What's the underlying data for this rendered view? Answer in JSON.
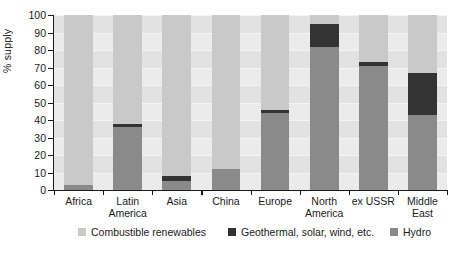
{
  "chart_data": {
    "type": "bar",
    "title": "",
    "subtitle": "",
    "xlabel": "",
    "ylabel": "% supply",
    "ylim": [
      0,
      100
    ],
    "ytick_labels": [
      "100",
      "90",
      "80",
      "70",
      "60",
      "50",
      "40",
      "30",
      "20",
      "10",
      "0"
    ],
    "ytick_values": [
      100,
      90,
      80,
      70,
      60,
      50,
      40,
      30,
      20,
      10,
      0
    ],
    "grid": true,
    "stacked": true,
    "legend_position": "bottom",
    "categories": [
      "Africa",
      "Latin\nAmerica",
      "Asia",
      "China",
      "Europe",
      "North\nAmerica",
      "ex USSR",
      "Middle\nEast"
    ],
    "series": [
      {
        "name": "Hydro",
        "color": "#8a8a8a",
        "values": [
          3,
          36,
          5,
          12,
          44,
          82,
          71,
          43
        ]
      },
      {
        "name": "Geothermal, solar, wind, etc.",
        "color": "#333333",
        "values": [
          0,
          2,
          3,
          0,
          2,
          13,
          2,
          24
        ]
      },
      {
        "name": "Combustible renewables",
        "color": "#c9c9c9",
        "values": [
          97,
          62,
          92,
          88,
          54,
          5,
          27,
          33
        ]
      }
    ]
  },
  "legend": {
    "items": [
      {
        "label": "Combustible renewables",
        "color": "#c9c9c9"
      },
      {
        "label": "Geothermal, solar, wind, etc.",
        "color": "#333333"
      },
      {
        "label": "Hydro",
        "color": "#8a8a8a"
      }
    ]
  },
  "colors": {
    "plot_background": "#ebebeb",
    "band": "#e2e2e2",
    "axis": "#1a1a1a",
    "text": "#1a1a1a"
  }
}
